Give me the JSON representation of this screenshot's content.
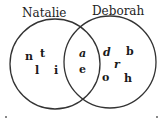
{
  "diagram": {
    "type": "venn",
    "sets": [
      {
        "name": "Natalie",
        "only": [
          "n",
          "t",
          "l",
          "i"
        ]
      },
      {
        "name": "Deborah",
        "only": [
          "d",
          "b",
          "r",
          "o",
          "h"
        ]
      }
    ],
    "intersection": [
      "a",
      "e"
    ],
    "colors": {
      "stroke": "#333333",
      "text": "#1a1a1a",
      "background": "#ffffff"
    }
  }
}
